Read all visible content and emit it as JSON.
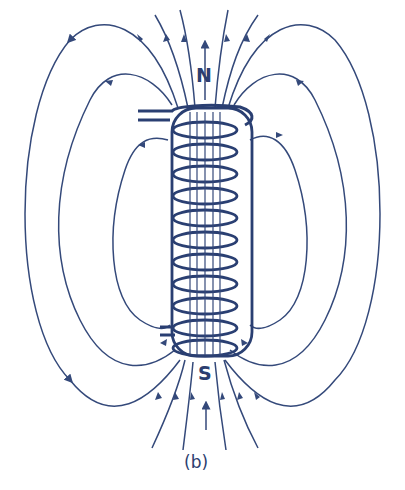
{
  "figure": {
    "caption": "(b)",
    "north_label": "N",
    "south_label": "S",
    "colors": {
      "line": "#34497a",
      "coil": "#2a3f72",
      "background": "#ffffff"
    },
    "coil_turns": 11
  }
}
